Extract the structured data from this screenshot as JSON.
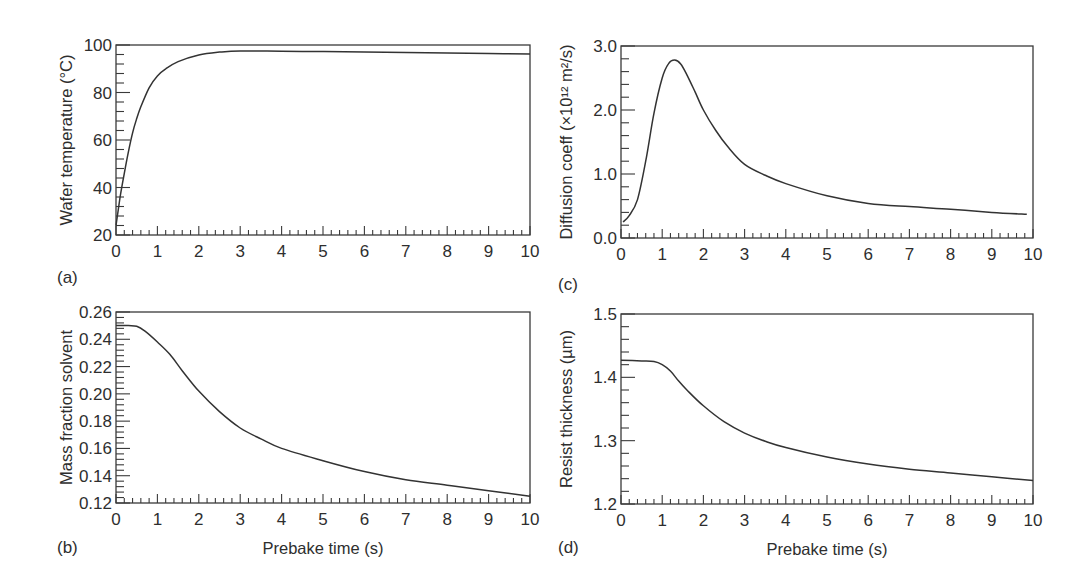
{
  "figure": {
    "x_axis_label": "Prebake time (s)",
    "x_ticks": [
      "0",
      "1",
      "2",
      "3",
      "4",
      "5",
      "6",
      "7",
      "8",
      "9",
      "10"
    ]
  },
  "chart_data": [
    {
      "panel": "(a)",
      "type": "line",
      "title": "",
      "xlabel": "",
      "ylabel": "Wafer temperature (°C)",
      "xlim": [
        0,
        10
      ],
      "ylim": [
        20,
        100
      ],
      "x_ticks": [
        0,
        1,
        2,
        3,
        4,
        5,
        6,
        7,
        8,
        9,
        10
      ],
      "y_ticks": [
        20,
        40,
        60,
        80,
        100
      ],
      "y_tick_labels": [
        "20",
        "40",
        "60",
        "80",
        "100"
      ],
      "y_minor_step": 4,
      "x_minor_step": 0.2,
      "grid": false,
      "series": [
        {
          "name": "Wafer temperature",
          "x": [
            0,
            0.1,
            0.2,
            0.3,
            0.4,
            0.5,
            0.6,
            0.8,
            1.0,
            1.2,
            1.5,
            2.0,
            2.5,
            3.0,
            4.0,
            5.0,
            6.0,
            7.0,
            8.0,
            9.0,
            10.0
          ],
          "y": [
            24,
            36,
            46,
            55,
            63,
            69,
            74,
            82,
            87,
            90,
            93,
            95.8,
            97,
            97.5,
            97.4,
            97.2,
            97,
            96.8,
            96.6,
            96.4,
            96.2
          ]
        }
      ]
    },
    {
      "panel": "(b)",
      "type": "line",
      "title": "",
      "xlabel": "Prebake time (s)",
      "ylabel": "Mass fraction solvent",
      "xlim": [
        0,
        10
      ],
      "ylim": [
        0.12,
        0.26
      ],
      "x_ticks": [
        0,
        1,
        2,
        3,
        4,
        5,
        6,
        7,
        8,
        9,
        10
      ],
      "y_ticks": [
        0.12,
        0.14,
        0.16,
        0.18,
        0.2,
        0.22,
        0.24,
        0.26
      ],
      "y_tick_labels": [
        "0.12",
        "0.14",
        "0.16",
        "0.18",
        "0.20",
        "0.22",
        "0.24",
        "0.26"
      ],
      "y_minor_step": 0.004,
      "x_minor_step": 0.2,
      "grid": false,
      "series": [
        {
          "name": "Mass fraction solvent",
          "x": [
            0,
            0.3,
            0.5,
            0.7,
            1.0,
            1.3,
            1.6,
            2.0,
            2.5,
            3.0,
            3.5,
            4.0,
            5.0,
            6.0,
            7.0,
            8.0,
            9.0,
            10.0
          ],
          "y": [
            0.25,
            0.25,
            0.2495,
            0.246,
            0.238,
            0.229,
            0.217,
            0.202,
            0.187,
            0.175,
            0.167,
            0.16,
            0.151,
            0.143,
            0.137,
            0.133,
            0.129,
            0.125
          ]
        }
      ]
    },
    {
      "panel": "(c)",
      "type": "line",
      "title": "",
      "xlabel": "",
      "ylabel": "Diffusion coeff (×10¹² m²/s)",
      "xlim": [
        0,
        10
      ],
      "ylim": [
        0.0,
        3.0
      ],
      "x_ticks": [
        0,
        1,
        2,
        3,
        4,
        5,
        6,
        7,
        8,
        9,
        10
      ],
      "y_ticks": [
        0.0,
        1.0,
        2.0,
        3.0
      ],
      "y_tick_labels": [
        "0.0",
        "1.0",
        "2.0",
        "3.0"
      ],
      "y_minor_step": 0.2,
      "x_minor_step": 0.2,
      "grid": false,
      "series": [
        {
          "name": "Diffusion coefficient",
          "x": [
            0.05,
            0.2,
            0.4,
            0.6,
            0.8,
            1.0,
            1.15,
            1.3,
            1.45,
            1.6,
            1.8,
            2.0,
            2.3,
            2.6,
            3.0,
            3.5,
            4.0,
            5.0,
            6.0,
            7.0,
            8.0,
            9.0,
            9.85
          ],
          "y": [
            0.25,
            0.35,
            0.6,
            1.2,
            1.95,
            2.5,
            2.72,
            2.78,
            2.72,
            2.55,
            2.28,
            2.0,
            1.68,
            1.42,
            1.15,
            0.98,
            0.85,
            0.66,
            0.54,
            0.49,
            0.45,
            0.4,
            0.37
          ]
        }
      ]
    },
    {
      "panel": "(d)",
      "type": "line",
      "title": "",
      "xlabel": "Prebake time (s)",
      "ylabel": "Resist thickness (µm)",
      "xlim": [
        0,
        10
      ],
      "ylim": [
        1.2,
        1.5
      ],
      "x_ticks": [
        0,
        1,
        2,
        3,
        4,
        5,
        6,
        7,
        8,
        9,
        10
      ],
      "y_ticks": [
        1.2,
        1.3,
        1.4,
        1.5
      ],
      "y_tick_labels": [
        "1.2",
        "1.3",
        "1.4",
        "1.5"
      ],
      "y_minor_step": 0.02,
      "x_minor_step": 0.2,
      "grid": false,
      "series": [
        {
          "name": "Resist thickness",
          "x": [
            0,
            0.5,
            0.8,
            1.0,
            1.2,
            1.4,
            1.6,
            2.0,
            2.5,
            3.0,
            3.5,
            4.0,
            5.0,
            6.0,
            7.0,
            8.0,
            9.0,
            10.0
          ],
          "y": [
            1.427,
            1.426,
            1.425,
            1.42,
            1.41,
            1.394,
            1.38,
            1.355,
            1.33,
            1.312,
            1.299,
            1.289,
            1.274,
            1.263,
            1.255,
            1.249,
            1.243,
            1.237
          ]
        }
      ]
    }
  ]
}
